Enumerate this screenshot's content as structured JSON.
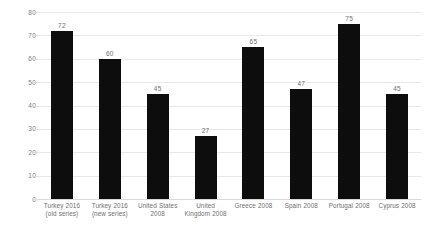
{
  "chart_data": {
    "type": "bar",
    "title": "",
    "subtitle": "",
    "xlabel": "",
    "ylabel": "",
    "ylim": [
      0,
      80
    ],
    "yticks": [
      0,
      10,
      20,
      30,
      40,
      50,
      60,
      70,
      80
    ],
    "grid": true,
    "legend": false,
    "legend_position": "none",
    "bar_color": "#0d0d0d",
    "gridline_color": "#e8e8e8",
    "label_color": "#6e6e6e",
    "background_color": "#ffffff",
    "categories": [
      "Turkey 2016 (old series)",
      "Turkey 2016 (new series)",
      "United States 2008",
      "United Kingdom 2008",
      "Greece 2008",
      "Spain 2008",
      "Portugal 2008",
      "Cyprus 2008"
    ],
    "category_lines": [
      [
        "Turkey 2016",
        "(old series)"
      ],
      [
        "Turkey 2016",
        "(new series)"
      ],
      [
        "United States",
        "2008"
      ],
      [
        "United",
        "Kingdom 2008"
      ],
      [
        "Greece 2008",
        ""
      ],
      [
        "Spain 2008",
        ""
      ],
      [
        "Portugal 2008",
        ""
      ],
      [
        "Cyprus 2008",
        ""
      ]
    ],
    "values": [
      72,
      60,
      45,
      27,
      65,
      47,
      75,
      45
    ],
    "value_labels": [
      "72",
      "60",
      "45",
      "27",
      "65",
      "47",
      "75",
      "45"
    ]
  },
  "axis": {
    "y": {
      "ticks": [
        "80",
        "70",
        "60",
        "50",
        "40",
        "30",
        "20",
        "10",
        "0"
      ]
    }
  }
}
